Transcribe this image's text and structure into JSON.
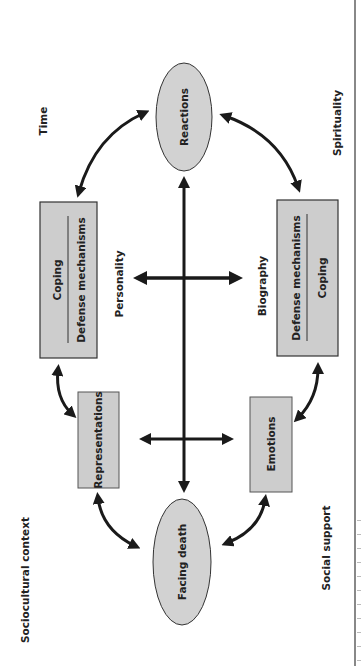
{
  "diagram": {
    "type": "conceptual-model",
    "orientation": "rotated-90-ccw",
    "context_labels": {
      "time": "Time",
      "spirituality": "Spirituality",
      "personality": "Personality",
      "biography": "Biography",
      "sociocultural": "Sociocultural context",
      "social_support": "Social support"
    },
    "nodes": {
      "reactions": "Reactions",
      "facing_death": "Facing death",
      "representations": "Representations",
      "emotions": "Emotions",
      "coping_left": {
        "top": "Coping",
        "bottom": "Defense mechanisms"
      },
      "coping_right": {
        "top": "Defense mechanisms",
        "bottom": "Coping"
      }
    },
    "colors": {
      "node_fill": "#cfcfcf",
      "stroke": "#1a1a1a",
      "background": "#ffffff"
    }
  }
}
